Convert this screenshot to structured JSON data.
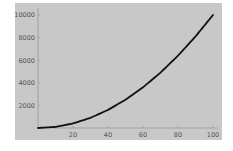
{
  "chart_data": {
    "type": "line",
    "title": "",
    "xlabel": "",
    "ylabel": "",
    "xlim": [
      0,
      100
    ],
    "ylim": [
      0,
      10000
    ],
    "grid": false,
    "legend": null,
    "x_ticks": [
      20,
      40,
      60,
      80,
      100
    ],
    "y_ticks": [
      2000,
      4000,
      6000,
      8000,
      10000
    ],
    "x_tick_labels": [
      "20",
      "40",
      "60",
      "80",
      "100"
    ],
    "y_tick_labels": [
      "2000",
      "4000",
      "6000",
      "8000",
      "10000"
    ],
    "series": [
      {
        "name": "y = x^2",
        "x": [
          0,
          10,
          20,
          30,
          40,
          50,
          60,
          70,
          80,
          90,
          100
        ],
        "values": [
          0,
          100,
          400,
          900,
          1600,
          2500,
          3600,
          4900,
          6400,
          8100,
          10000
        ]
      }
    ],
    "colors": {
      "background": "#c8c8c8",
      "line": "#111111",
      "axis": "#8a8a8a",
      "tick_label": "#555555"
    }
  }
}
